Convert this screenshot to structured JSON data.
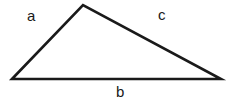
{
  "figure": {
    "name": "triangle-diagram",
    "background_color": "#ffffff",
    "stroke_color": "#1a1a1a",
    "stroke_width": 2.6,
    "width": 231,
    "height": 104
  },
  "shape": {
    "type": "triangle",
    "vertices": [
      {
        "name": "bottom-left",
        "x": 12,
        "y": 79
      },
      {
        "name": "apex",
        "x": 83,
        "y": 5
      },
      {
        "name": "bottom-right",
        "x": 221,
        "y": 79
      }
    ],
    "points_attr": "12,79 83,5 221,79"
  },
  "labels": {
    "a": "a",
    "b": "b",
    "c": "c"
  },
  "sides": [
    {
      "label": "a",
      "name": "side-a-left-edge",
      "from": "bottom-left",
      "to": "apex",
      "label_x": 27,
      "label_y": 8
    },
    {
      "label": "c",
      "name": "side-c-right-edge",
      "from": "apex",
      "to": "bottom-right",
      "label_x": 158,
      "label_y": 7
    },
    {
      "label": "b",
      "name": "side-b-base",
      "from": "bottom-left",
      "to": "bottom-right",
      "label_x": 116,
      "label_y": 84
    }
  ]
}
